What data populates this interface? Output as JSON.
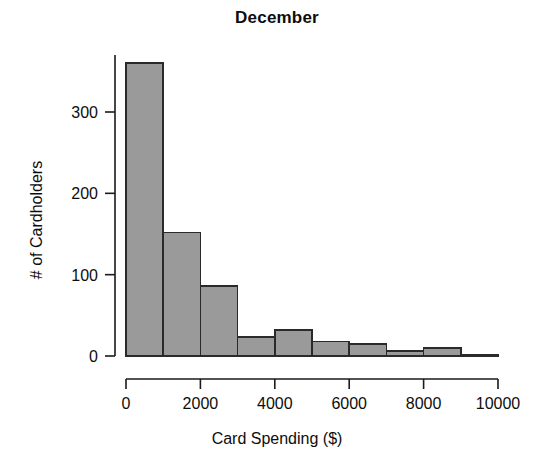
{
  "chart_data": {
    "type": "bar",
    "title": "December",
    "xlabel": "Card Spending ($)",
    "ylabel": "# of Cardholders",
    "categories": [
      "0-1000",
      "1000-2000",
      "2000-3000",
      "3000-4000",
      "4000-5000",
      "5000-6000",
      "6000-7000",
      "7000-8000",
      "8000-9000",
      "9000-10000"
    ],
    "bin_edges": [
      0,
      1000,
      2000,
      3000,
      4000,
      5000,
      6000,
      7000,
      8000,
      9000,
      10000
    ],
    "values": [
      360,
      152,
      86,
      23,
      32,
      18,
      15,
      6,
      10,
      2
    ],
    "bin_width": 1000,
    "xlim": [
      0,
      10000
    ],
    "ylim": [
      0,
      375
    ],
    "xticks": [
      0,
      2000,
      4000,
      6000,
      8000,
      10000
    ],
    "xtick_labels": [
      "0",
      "2000",
      "4000",
      "6000",
      "8000",
      "10000"
    ],
    "yticks": [
      0,
      100,
      200,
      300
    ],
    "ytick_labels": [
      "0",
      "100",
      "200",
      "300"
    ],
    "grid": false,
    "legend": false,
    "bar_fill_color": "#9a9a9a",
    "bar_edge_color": "#2a2a2a",
    "background_color": "#ffffff",
    "axis_color": "#1a1a1a"
  }
}
